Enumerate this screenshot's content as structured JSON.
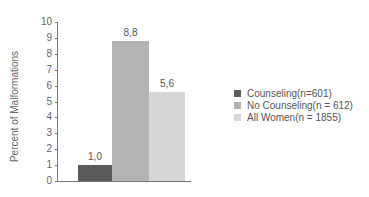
{
  "chart_data": {
    "type": "bar",
    "title": "",
    "xlabel": "",
    "ylabel": "Percent of Malformations",
    "ylim": [
      0,
      10
    ],
    "yticks": [
      "0",
      "1",
      "2",
      "3",
      "4",
      "5",
      "6",
      "7",
      "8",
      "9",
      "10"
    ],
    "categories": [
      "Counseling(n=601)",
      "No Counseling(n = 612)",
      "All Women(n = 1855)"
    ],
    "values": [
      1.0,
      8.8,
      5.6
    ],
    "value_labels": [
      "1,0",
      "8,8",
      "5,6"
    ],
    "colors": [
      "#5a5a5a",
      "#b3b3b3",
      "#d6d6d6"
    ],
    "grid": false,
    "legend_position": "right"
  }
}
